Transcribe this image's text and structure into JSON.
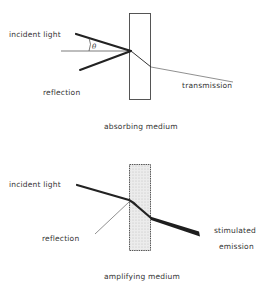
{
  "panels": [
    {
      "id": "absorbing",
      "caption": "absorbing medium",
      "labels": {
        "incident": "incident light",
        "reflection": "reflection",
        "transmission": "transmission",
        "angle": "θ"
      }
    },
    {
      "id": "amplifying",
      "caption": "amplifying medium",
      "labels": {
        "incident": "incident light",
        "reflection": "reflection",
        "emission_line1": "stimulated",
        "emission_line2": "emission"
      }
    }
  ],
  "colors": {
    "line": "#2a2a2a",
    "medium_border": "#444444",
    "amplifying_fill": "#e6e6e6"
  }
}
